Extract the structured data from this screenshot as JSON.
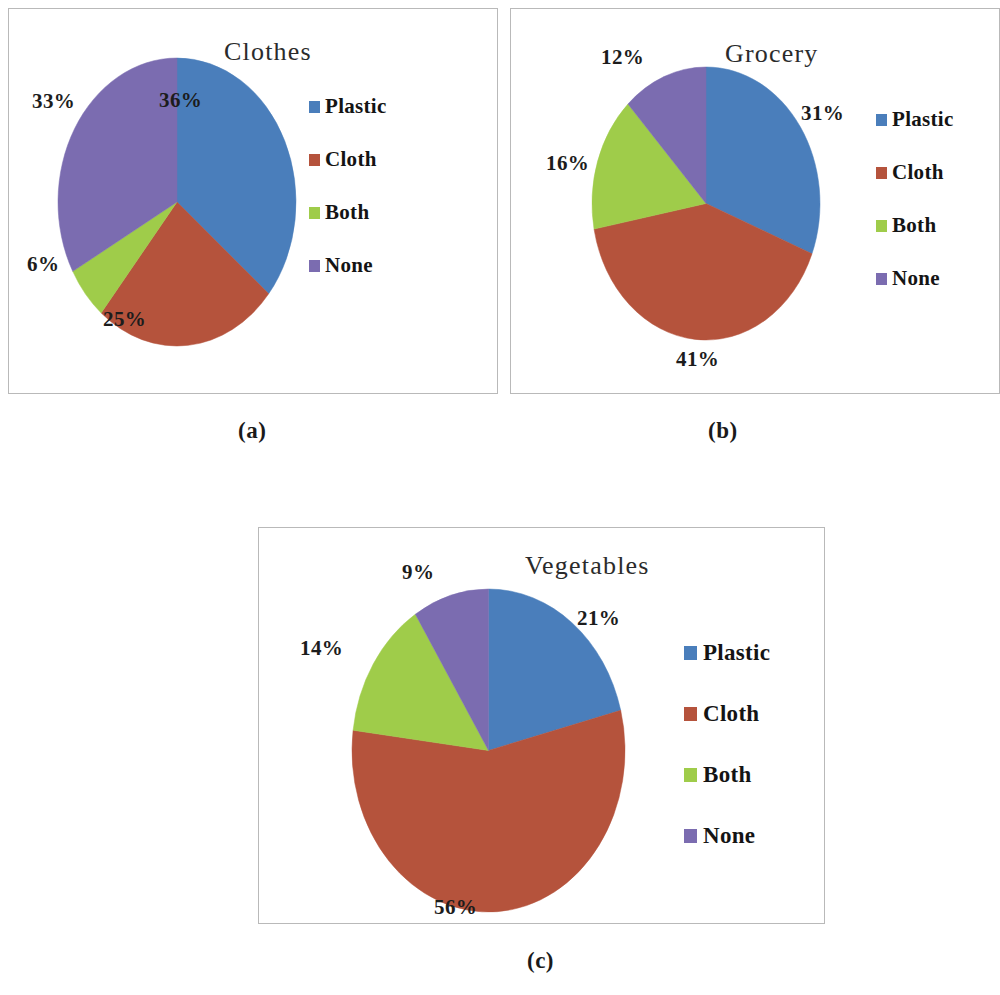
{
  "figure": {
    "background": "#ffffff",
    "panel_border_color": "#b9b9b9",
    "captions": {
      "a": "(a)",
      "b": "(b)",
      "c": "(c)"
    }
  },
  "palette": {
    "plastic": "#4a7ebb",
    "cloth": "#b5533c",
    "both": "#9fcc4a",
    "none": "#7b6cb0"
  },
  "legend": {
    "items": [
      {
        "label": "Plastic",
        "color": "#4a7ebb"
      },
      {
        "label": "Cloth",
        "color": "#b5533c"
      },
      {
        "label": "Both",
        "color": "#9fcc4a"
      },
      {
        "label": "None",
        "color": "#7b6cb0"
      }
    ]
  },
  "chart_data": [
    {
      "type": "pie",
      "title": "Clothes",
      "panel": "(a)",
      "categories": [
        "Plastic",
        "Cloth",
        "Both",
        "None"
      ],
      "values": [
        36,
        25,
        6,
        33
      ],
      "labels": [
        "36%",
        "25%",
        "6%",
        "33%"
      ],
      "colors": [
        "#4a7ebb",
        "#b5533c",
        "#9fcc4a",
        "#7b6cb0"
      ],
      "legend_position": "right",
      "start_angle_deg": 0,
      "direction": "clockwise",
      "units": "percent"
    },
    {
      "type": "pie",
      "title": "Grocery",
      "panel": "(b)",
      "categories": [
        "Plastic",
        "Cloth",
        "Both",
        "None"
      ],
      "values": [
        31,
        41,
        16,
        12
      ],
      "labels": [
        "31%",
        "41%",
        "16%",
        "12%"
      ],
      "colors": [
        "#4a7ebb",
        "#b5533c",
        "#9fcc4a",
        "#7b6cb0"
      ],
      "legend_position": "right",
      "start_angle_deg": 0,
      "direction": "clockwise",
      "units": "percent"
    },
    {
      "type": "pie",
      "title": "Vegetables",
      "panel": "(c)",
      "categories": [
        "Plastic",
        "Cloth",
        "Both",
        "None"
      ],
      "values": [
        21,
        56,
        14,
        9
      ],
      "labels": [
        "21%",
        "56%",
        "14%",
        "9%"
      ],
      "colors": [
        "#4a7ebb",
        "#b5533c",
        "#9fcc4a",
        "#7b6cb0"
      ],
      "legend_position": "right",
      "start_angle_deg": 0,
      "direction": "clockwise",
      "units": "percent"
    }
  ]
}
